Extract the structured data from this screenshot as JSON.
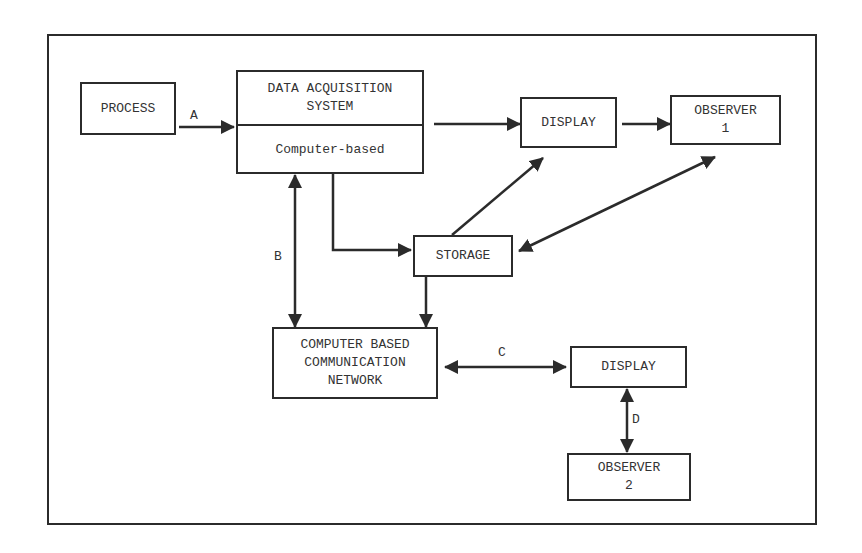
{
  "diagram": {
    "nodes": {
      "process": "PROCESS",
      "das_title": "DATA ACQUISITION\nSYSTEM",
      "das_sub": "Computer-based",
      "display1": "DISPLAY",
      "observer1": "OBSERVER\n1",
      "storage": "STORAGE",
      "network": "COMPUTER BASED\nCOMMUNICATION\nNETWORK",
      "display2": "DISPLAY",
      "observer2": "OBSERVER\n2"
    },
    "edge_labels": {
      "a": "A",
      "b": "B",
      "c": "C",
      "d": "D"
    },
    "colors": {
      "line": "#2b2b2b",
      "background": "#ffffff"
    }
  }
}
